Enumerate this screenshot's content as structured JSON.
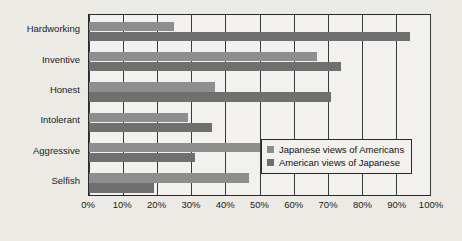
{
  "chart_data": {
    "type": "bar",
    "orientation": "horizontal",
    "title": "",
    "subtitle": "",
    "xlabel": "",
    "ylabel": "",
    "xlim": [
      0,
      100
    ],
    "xticks": [
      0,
      10,
      20,
      30,
      40,
      50,
      60,
      70,
      80,
      90,
      100
    ],
    "xtick_labels": [
      "0%",
      "10%",
      "20%",
      "30%",
      "40%",
      "50%",
      "60%",
      "70%",
      "80%",
      "90%",
      "100%"
    ],
    "grid": "vertical",
    "legend_position": "inside-lower-right",
    "categories": [
      "Hardworking",
      "Inventive",
      "Honest",
      "Intolerant",
      "Aggressive",
      "Selfish"
    ],
    "series": [
      {
        "name": "Japanese views of Americans",
        "color": "#8e8e8e",
        "values": [
          25,
          67,
          37,
          29,
          50,
          47
        ]
      },
      {
        "name": "American views of Japanese",
        "color": "#6f6f6f",
        "values": [
          94,
          74,
          71,
          36,
          31,
          19
        ]
      }
    ],
    "colors": {
      "background": "#eceae5",
      "plot_background": "#f2f1ed",
      "axis_line": "#2a2a2a",
      "gridline": "#3a3a3a",
      "text": "#1a1a1a"
    }
  }
}
